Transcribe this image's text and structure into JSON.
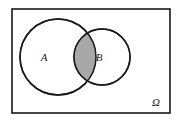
{
  "figure": {
    "kind": "venn-diagram",
    "background_color": "#ffffff"
  },
  "universe": {
    "label": "Ω",
    "label_name": "omega-symbol",
    "border_color": "#1a1a1a",
    "fill_color": "#ffffff",
    "x": 12,
    "y": 9,
    "width": 158,
    "height": 104,
    "stroke_width": 1.6,
    "label_x": 156,
    "label_y": 106
  },
  "sets": [
    {
      "label": "A",
      "name": "circle-a",
      "cx": 58,
      "cy": 57,
      "r": 38,
      "stroke_color": "#1a1a1a",
      "fill_color": "#ffffff",
      "stroke_width": 1.5,
      "label_x": 44,
      "label_y": 61
    },
    {
      "label": "B",
      "name": "circle-b",
      "cx": 102,
      "cy": 57,
      "r": 28,
      "stroke_color": "#1a1a1a",
      "fill_color": "#ffffff",
      "stroke_width": 1.5,
      "label_x": 99,
      "label_y": 61
    }
  ],
  "intersection": {
    "name": "a-intersect-b",
    "shaded": true,
    "fill_color": "#a8a8a8",
    "stroke_color": "#1a1a1a",
    "stroke_width": 1.5
  }
}
